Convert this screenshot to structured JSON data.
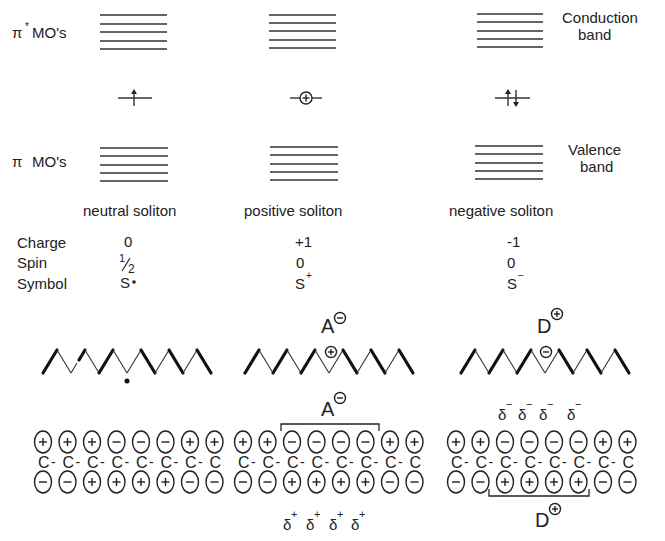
{
  "axis_labels": {
    "pi_star": "π* MO's",
    "pi_star_symbol": "π",
    "pi_star_sup": "*",
    "pi_star_rest": "MO's",
    "pi": "π MO's",
    "pi_symbol": "π",
    "pi_rest": "MO's",
    "conduction_line1": "Conduction",
    "conduction_line2": "band",
    "valence_line1": "Valence",
    "valence_line2": "band"
  },
  "solitons": [
    {
      "name": "neutral soliton",
      "midgap_occupancy": "single up-arrow (one electron)",
      "charge": "0",
      "spin": "1/2",
      "spin_num": "1",
      "spin_den": "2",
      "symbol": "S·",
      "symbol_base": "S",
      "symbol_sup": "·",
      "chain_marker": "•",
      "orbitals_top": [
        "+",
        "+",
        "+",
        "−",
        "−",
        "−",
        "+",
        "+"
      ],
      "orbitals_bottom": [
        "−",
        "−",
        "+",
        "+",
        "+",
        "+",
        "−",
        "−"
      ]
    },
    {
      "name": "positive soliton",
      "midgap_occupancy": "empty (circled +)",
      "charge": "+1",
      "spin": "0",
      "symbol": "S+",
      "symbol_base": "S",
      "symbol_sup": "+",
      "chain_marker": "⊕",
      "dopant": "A",
      "dopant_charge": "−",
      "orbitals_top": [
        "+",
        "+",
        "−",
        "−",
        "−",
        "−",
        "+",
        "+"
      ],
      "orbitals_bottom": [
        "−",
        "−",
        "+",
        "+",
        "+",
        "+",
        "−",
        "−"
      ],
      "delta_label": "δ",
      "delta_sign": "+",
      "delta_count": 4
    },
    {
      "name": "negative soliton",
      "midgap_occupancy": "two electrons (up and down arrows)",
      "charge": "-1",
      "spin": "0",
      "symbol": "S−",
      "symbol_base": "S",
      "symbol_sup": "−",
      "chain_marker": "⊖",
      "dopant": "D",
      "dopant_charge": "+",
      "orbitals_top": [
        "+",
        "+",
        "−",
        "−",
        "−",
        "−",
        "+",
        "+"
      ],
      "orbitals_bottom": [
        "−",
        "−",
        "+",
        "+",
        "+",
        "+",
        "−",
        "−"
      ],
      "delta_label": "δ",
      "delta_sign": "−",
      "delta_count": 4
    }
  ],
  "row_labels": {
    "charge": "Charge",
    "spin": "Spin",
    "symbol": "Symbol"
  },
  "chain_atom": "C",
  "bond": "-",
  "energy_levels_per_band": 5
}
